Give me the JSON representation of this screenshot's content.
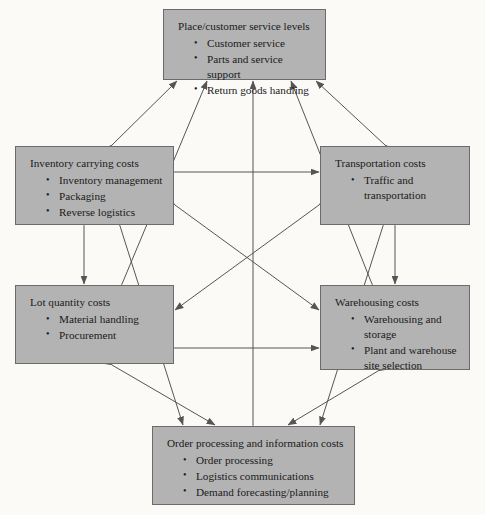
{
  "diagram": {
    "type": "cost-tradeoff-network",
    "box_fill": "#b3b3b3",
    "box_border": "#6b6b6b",
    "arrow_color": "#555555",
    "background": "#fbfaf7",
    "nodes": [
      {
        "id": "place",
        "title": "Place/customer service levels",
        "items": [
          "Customer service",
          "Parts and service support",
          "Return goods handling"
        ]
      },
      {
        "id": "inventory",
        "title": "Inventory carrying costs",
        "items": [
          "Inventory management",
          "Packaging",
          "Reverse logistics"
        ]
      },
      {
        "id": "transport",
        "title": "Transportation costs",
        "items": [
          "Traffic and transportation"
        ]
      },
      {
        "id": "lot",
        "title": "Lot quantity costs",
        "items": [
          "Material handling",
          "Procurement"
        ]
      },
      {
        "id": "warehouse",
        "title": "Warehousing costs",
        "items": [
          "Warehousing and storage",
          "Plant and warehouse site selection"
        ]
      },
      {
        "id": "order",
        "title": "Order processing and information costs",
        "items": [
          "Order processing",
          "Logistics communications",
          "Demand forecasting/planning"
        ]
      }
    ],
    "connections": [
      {
        "from": "inventory",
        "to": "place",
        "style": "double"
      },
      {
        "from": "transport",
        "to": "place",
        "style": "double"
      },
      {
        "from": "lot",
        "to": "place",
        "style": "double"
      },
      {
        "from": "warehouse",
        "to": "place",
        "style": "double"
      },
      {
        "from": "order",
        "to": "place",
        "style": "double"
      },
      {
        "from": "inventory",
        "to": "transport",
        "style": "double"
      },
      {
        "from": "inventory",
        "to": "lot",
        "style": "double"
      },
      {
        "from": "inventory",
        "to": "warehouse",
        "style": "double"
      },
      {
        "from": "inventory",
        "to": "order",
        "style": "double"
      },
      {
        "from": "transport",
        "to": "warehouse",
        "style": "double"
      },
      {
        "from": "transport",
        "to": "lot",
        "style": "double"
      },
      {
        "from": "transport",
        "to": "order",
        "style": "double"
      },
      {
        "from": "lot",
        "to": "warehouse",
        "style": "double"
      },
      {
        "from": "lot",
        "to": "order",
        "style": "double"
      },
      {
        "from": "warehouse",
        "to": "order",
        "style": "double"
      }
    ]
  }
}
